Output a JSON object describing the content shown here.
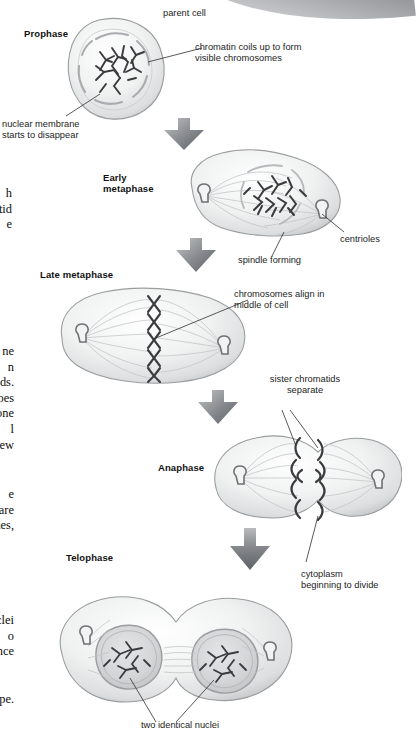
{
  "figure": {
    "phases": [
      {
        "id": "prophase",
        "label": "Prophase"
      },
      {
        "id": "early-metaphase",
        "label": "Early\nmetaphase"
      },
      {
        "id": "late-metaphase",
        "label": "Late metaphase"
      },
      {
        "id": "anaphase",
        "label": "Anaphase"
      },
      {
        "id": "telophase",
        "label": "Telophase"
      }
    ],
    "callouts": {
      "parent_cell": "parent cell",
      "chromatin": "chromatin coils up to form\nvisible chromosomes",
      "nuclear_membrane": "nuclear membrane\nstarts to disappear",
      "centrioles": "centrioles",
      "spindle": "spindle forming",
      "align": "chromosomes align in\nmiddle of cell",
      "sister_chromatids": "sister chromatids\nseparate",
      "cytoplasm": "cytoplasm\nbeginning to divide",
      "two_nuclei": "two identical nuclei"
    }
  },
  "body_column": {
    "frag_1": "h\nmatid\ne",
    "frag_2": "ne\nn\natids.\noes\none\nl\nnew",
    "frag_3": "e\nre are\nnes,",
    "frag_4": "nuclei\no\nonce",
    "frag_5": "scope."
  },
  "colors": {
    "cell_outline": "#8a8d90",
    "cell_fill": "#e9eaeb",
    "chromosome": "#3b3b3f",
    "arrow": "#6f7276",
    "text": "#1a1a1a",
    "band": "#7b7e82"
  }
}
